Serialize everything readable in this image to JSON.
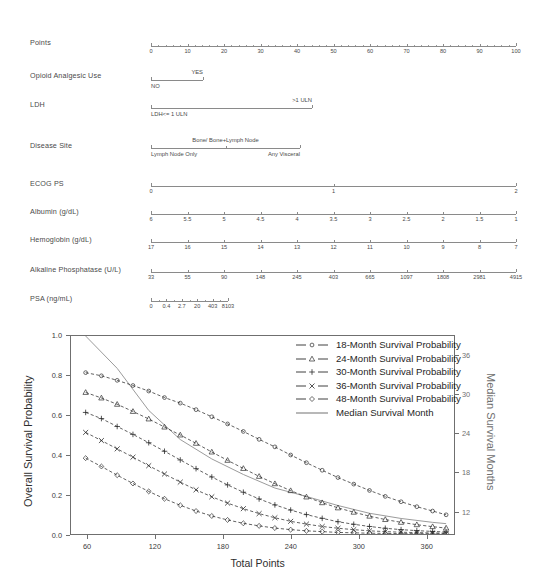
{
  "figure": {
    "kind": "nomogram-with-survival-plot"
  },
  "nomogram": {
    "rows": [
      {
        "label": "Points",
        "type": "numeric-axis",
        "ticks": [
          "0",
          "10",
          "20",
          "30",
          "40",
          "50",
          "60",
          "70",
          "80",
          "90",
          "100"
        ],
        "minor_per_interval": 5
      },
      {
        "label": "Opioid Analgesic Use",
        "type": "categorical",
        "categories": [
          "NO",
          "YES"
        ]
      },
      {
        "label": "LDH",
        "type": "categorical",
        "categories": [
          "LDH<= 1 ULN",
          ">1 ULN"
        ]
      },
      {
        "label": "Disease Site",
        "type": "categorical",
        "categories": [
          "Lymph Node Only",
          "Bone/ Bone+Lymph Node",
          "Any Visceral"
        ]
      },
      {
        "label": "ECOG PS",
        "type": "numeric-axis",
        "ticks": [
          "0",
          "1",
          "2"
        ]
      },
      {
        "label": "Albumin  (g/dL)",
        "type": "numeric-axis",
        "ticks": [
          "6",
          "5.5",
          "5",
          "4.5",
          "4",
          "3.5",
          "3",
          "2.5",
          "2",
          "1.5",
          "1"
        ]
      },
      {
        "label": "Hemoglobin (g/dL)",
        "type": "numeric-axis",
        "ticks": [
          "17",
          "16",
          "15",
          "14",
          "13",
          "12",
          "11",
          "10",
          "9",
          "8",
          "7"
        ]
      },
      {
        "label": "Alkaline Phosphatase  (U/L)",
        "type": "numeric-axis",
        "ticks": [
          "33",
          "55",
          "90",
          "148",
          "245",
          "403",
          "665",
          "1097",
          "1808",
          "2981",
          "4915"
        ]
      },
      {
        "label": "PSA    (ng/mL)",
        "type": "numeric-axis",
        "ticks": [
          "0",
          "0.4",
          "2.7",
          "20",
          "403",
          "8103"
        ],
        "minor_per_interval": 2
      }
    ]
  },
  "chart_data": {
    "type": "line",
    "title": "",
    "xlabel": "Total Points",
    "ylabel": "Overall Survival Probability",
    "y2label": "Median Survival Months",
    "xlim": [
      45,
      385
    ],
    "ylim": [
      0.0,
      1.0
    ],
    "y2lim": [
      8.4,
      39.0
    ],
    "xticks": [
      60,
      120,
      180,
      240,
      300,
      360
    ],
    "yticks": [
      "0.0",
      "0.2",
      "0.4",
      "0.6",
      "0.8",
      "1.0"
    ],
    "y2ticks": [
      12,
      18,
      24,
      30,
      36
    ],
    "grid": false,
    "legend_position": "top-right",
    "x": [
      58,
      72,
      86,
      100,
      114,
      128,
      142,
      156,
      170,
      184,
      198,
      212,
      226,
      240,
      254,
      268,
      282,
      296,
      310,
      324,
      338,
      352,
      366,
      378
    ],
    "series": [
      {
        "name": "18-Month Survival Probability",
        "marker": "circle-small",
        "linestyle": "dashed",
        "values": [
          0.815,
          0.799,
          0.776,
          0.75,
          0.722,
          0.689,
          0.661,
          0.628,
          0.592,
          0.556,
          0.518,
          0.478,
          0.44,
          0.399,
          0.36,
          0.322,
          0.285,
          0.252,
          0.22,
          0.19,
          0.163,
          0.138,
          0.116,
          0.097
        ]
      },
      {
        "name": "24-Month Survival Probability",
        "marker": "triangle",
        "linestyle": "dashed",
        "values": [
          0.715,
          0.687,
          0.655,
          0.619,
          0.581,
          0.54,
          0.5,
          0.458,
          0.414,
          0.372,
          0.331,
          0.291,
          0.254,
          0.219,
          0.187,
          0.158,
          0.132,
          0.11,
          0.09,
          0.073,
          0.059,
          0.047,
          0.037,
          0.03
        ]
      },
      {
        "name": "30-Month Survival Probability",
        "marker": "plus",
        "linestyle": "dashed",
        "values": [
          0.614,
          0.583,
          0.543,
          0.503,
          0.461,
          0.418,
          0.374,
          0.33,
          0.288,
          0.248,
          0.211,
          0.177,
          0.147,
          0.121,
          0.098,
          0.079,
          0.062,
          0.049,
          0.038,
          0.029,
          0.022,
          0.017,
          0.013,
          0.01
        ]
      },
      {
        "name": "36-Month Survival Probability",
        "marker": "cross",
        "linestyle": "dashed",
        "values": [
          0.513,
          0.472,
          0.43,
          0.388,
          0.345,
          0.303,
          0.262,
          0.223,
          0.188,
          0.156,
          0.128,
          0.103,
          0.082,
          0.064,
          0.05,
          0.038,
          0.029,
          0.022,
          0.016,
          0.012,
          0.009,
          0.007,
          0.005,
          0.004
        ]
      },
      {
        "name": "48-Month Survival Probability",
        "marker": "diamond",
        "linestyle": "dashed",
        "values": [
          0.383,
          0.341,
          0.297,
          0.255,
          0.215,
          0.178,
          0.145,
          0.116,
          0.091,
          0.071,
          0.054,
          0.041,
          0.03,
          0.022,
          0.016,
          0.012,
          0.008,
          0.006,
          0.004,
          0.003,
          0.002,
          0.002,
          0.001,
          0.001
        ]
      }
    ],
    "median_series": {
      "name": "Median Survival Month",
      "marker": "none",
      "linestyle": "solid",
      "color": "#9a9a9a",
      "x": [
        58,
        86,
        114,
        142,
        170,
        198,
        226,
        254,
        282,
        310,
        338,
        366,
        378
      ],
      "values_months": [
        39.0,
        34.0,
        27.5,
        23.0,
        20.0,
        17.6,
        15.5,
        14.2,
        12.8,
        11.6,
        10.8,
        10.2,
        10.0
      ]
    }
  }
}
